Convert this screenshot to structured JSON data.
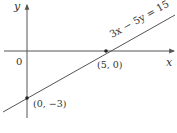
{
  "diagram": {
    "type": "coordinate-plane-line",
    "axes": {
      "x_label": "x",
      "y_label": "y",
      "origin_label": "0"
    },
    "line": {
      "equation": "3x − 5y = 15",
      "slope": 0.6,
      "color": "#555555"
    },
    "points": [
      {
        "label": "(5, 0)",
        "x": 5,
        "y": 0
      },
      {
        "label": "(0, −3)",
        "x": 0,
        "y": -3
      }
    ],
    "colors": {
      "axis": "#555555",
      "text": "#333333",
      "point": "#222222"
    }
  }
}
